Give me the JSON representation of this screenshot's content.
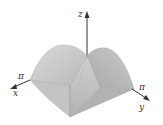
{
  "figure": {
    "type": "3d-surface",
    "axes": {
      "x": {
        "label": "x",
        "tick": "π"
      },
      "y": {
        "label": "y",
        "tick": "π"
      },
      "z": {
        "label": "z"
      }
    },
    "colors": {
      "surface_light": "#d4d4d4",
      "surface_mid": "#bdbdbd",
      "surface_dark": "#a8a8a8",
      "axis": "#333333",
      "background": "#ffffff"
    }
  }
}
